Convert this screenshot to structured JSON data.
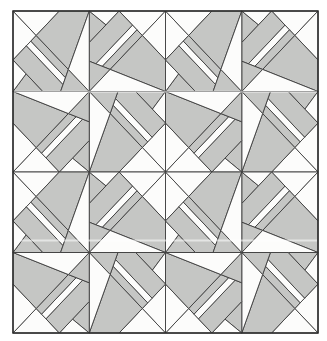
{
  "figure": {
    "kind": "quilt-block-pattern",
    "rows": 2,
    "cols": 2
  },
  "canvas": {
    "width": 327,
    "height": 341,
    "background": "#ffffff"
  },
  "pattern": {
    "origin_x": 13,
    "origin_y": 11,
    "block_w": 152.5,
    "block_h": 161,
    "seam_stroke": 0.9,
    "border_stroke": 1.5,
    "colors": {
      "shade": "#c5c6c4",
      "bg": "#fcfcfb",
      "line": "#3d3d3d",
      "border": "#2b2b2b"
    }
  },
  "pieces": [
    {
      "name": "blade",
      "fill": "shade",
      "points": [
        [
          0.5,
          0
        ],
        [
          0.61,
          0.086
        ],
        [
          0.5,
          0.196
        ]
      ]
    },
    {
      "name": "blade-notch",
      "fill": "bg",
      "points": [
        [
          0.5,
          0
        ],
        [
          0.696,
          0
        ],
        [
          0.61,
          0.086
        ]
      ]
    },
    {
      "name": "corner-triangle-a",
      "fill": "bg",
      "points": [
        [
          0.696,
          0
        ],
        [
          1,
          0
        ],
        [
          0.848,
          0.152
        ]
      ]
    },
    {
      "name": "corner-triangle-b",
      "fill": "bg",
      "points": [
        [
          1,
          0
        ],
        [
          1,
          0.304
        ],
        [
          0.848,
          0.152
        ]
      ]
    },
    {
      "name": "outer-band",
      "fill": "shade",
      "points": [
        [
          0.696,
          0
        ],
        [
          0.784,
          0.088
        ],
        [
          0.5436,
          0.328
        ],
        [
          0.5,
          0.312
        ],
        [
          0.5,
          0.196
        ]
      ]
    },
    {
      "name": "band-gap",
      "fill": "bg",
      "points": [
        [
          0.784,
          0.088
        ],
        [
          0.813,
          0.117
        ],
        [
          0.5857,
          0.344
        ],
        [
          0.5436,
          0.328
        ]
      ]
    },
    {
      "name": "mid-band",
      "fill": "shade",
      "points": [
        [
          0.813,
          0.117
        ],
        [
          0.848,
          0.152
        ],
        [
          0.637,
          0.363
        ],
        [
          0.5857,
          0.344
        ]
      ]
    },
    {
      "name": "corner-band",
      "fill": "shade",
      "points": [
        [
          0.848,
          0.152
        ],
        [
          1,
          0.304
        ],
        [
          1,
          0.5
        ],
        [
          0.637,
          0.363
        ]
      ]
    },
    {
      "name": "inner-blade",
      "fill": "shade",
      "points": [
        [
          0.5,
          0.5
        ],
        [
          0.5,
          0.312
        ],
        [
          0.637,
          0.363
        ]
      ]
    },
    {
      "name": "center-notch",
      "fill": "bg",
      "points": [
        [
          0.5,
          0.5
        ],
        [
          0.637,
          0.363
        ],
        [
          1,
          0.5
        ]
      ]
    }
  ],
  "artifacts": [
    {
      "y": 91.8,
      "x1": 14,
      "x2": 317,
      "opacity": 0.5
    },
    {
      "y": 240.6,
      "x1": 14,
      "x2": 317,
      "opacity": 0.55
    }
  ]
}
